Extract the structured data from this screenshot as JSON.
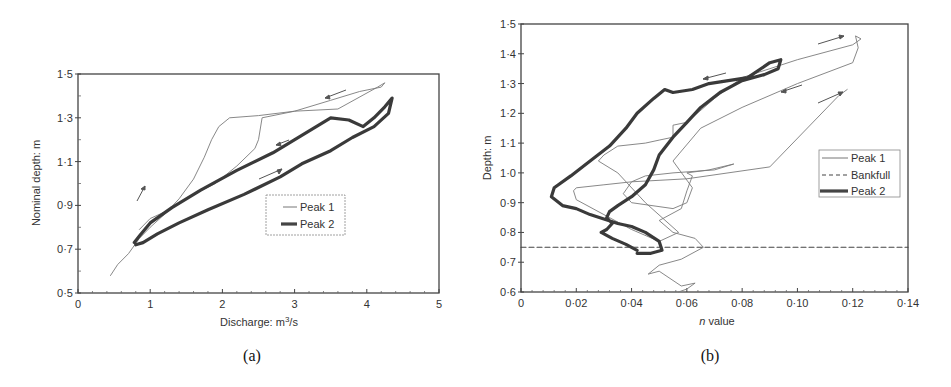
{
  "chart_data": [
    {
      "type": "line",
      "panel": "a",
      "caption": "(a)",
      "title": "",
      "xlabel": "Discharge: m³/s",
      "ylabel": "Nominal depth: m",
      "xlim": [
        0,
        5
      ],
      "ylim": [
        0.5,
        1.5
      ],
      "xticks": [
        "0",
        "1",
        "2",
        "3",
        "4",
        "5"
      ],
      "yticks": [
        "0·5",
        "0·7",
        "0·9",
        "1·1",
        "1·3",
        "1·5"
      ],
      "grid": false,
      "legend": {
        "position": "center-right",
        "entries": [
          "Peak 1",
          "Peak 2"
        ]
      },
      "series": [
        {
          "name": "Peak 1",
          "style": "thin",
          "x": [
            0.45,
            0.55,
            0.7,
            0.85,
            1.0,
            1.2,
            1.4,
            1.6,
            1.75,
            1.85,
            1.95,
            2.1,
            2.5,
            3.0,
            3.5,
            3.9,
            4.2,
            4.25,
            4.15,
            3.6,
            3.0,
            2.55,
            2.5,
            2.45,
            2.2,
            1.9,
            1.6,
            1.4,
            1.2,
            1.0,
            0.85
          ],
          "y": [
            0.58,
            0.63,
            0.68,
            0.75,
            0.8,
            0.86,
            0.93,
            1.02,
            1.12,
            1.2,
            1.26,
            1.3,
            1.31,
            1.33,
            1.38,
            1.42,
            1.44,
            1.46,
            1.44,
            1.34,
            1.33,
            1.3,
            1.2,
            1.16,
            1.08,
            1.0,
            0.95,
            0.91,
            0.87,
            0.84,
            0.79
          ]
        },
        {
          "name": "Peak 2",
          "style": "thick",
          "x": [
            0.8,
            0.9,
            1.1,
            1.4,
            1.8,
            2.3,
            2.8,
            3.1,
            3.5,
            3.8,
            4.1,
            4.3,
            4.35,
            4.25,
            4.1,
            3.95,
            3.75,
            3.5,
            3.1,
            2.7,
            2.2,
            1.7,
            1.3,
            1.0,
            0.85,
            0.78
          ],
          "y": [
            0.72,
            0.73,
            0.77,
            0.82,
            0.88,
            0.95,
            1.03,
            1.09,
            1.15,
            1.21,
            1.26,
            1.32,
            1.39,
            1.35,
            1.3,
            1.26,
            1.29,
            1.3,
            1.22,
            1.14,
            1.06,
            0.97,
            0.89,
            0.82,
            0.76,
            0.73
          ]
        }
      ],
      "annotations": [
        "arrow up-right at Q~1.9 (rising limb)",
        "arrow left at top near Q~3.8",
        "arrow left near Q~2.7,1.2",
        "arrow right near Q~2.8,1.05"
      ]
    },
    {
      "type": "line",
      "panel": "b",
      "caption": "(b)",
      "title": "",
      "xlabel": "n value",
      "ylabel": "Depth: m",
      "xlim": [
        0,
        0.14
      ],
      "ylim": [
        0.6,
        1.5
      ],
      "xticks": [
        "0",
        "0·02",
        "0·04",
        "0·06",
        "0·08",
        "0·10",
        "0·12",
        "0·14"
      ],
      "yticks": [
        "0·6",
        "0·7",
        "0·8",
        "0·9",
        "1·0",
        "1·1",
        "1·2",
        "1·3",
        "1·4",
        "1·5"
      ],
      "grid": false,
      "legend": {
        "position": "center-right",
        "entries": [
          "Peak 1",
          "Bankfull",
          "Peak 2"
        ]
      },
      "series": [
        {
          "name": "Peak 1",
          "style": "thin",
          "x": [
            0.057,
            0.06,
            0.063,
            0.058,
            0.05,
            0.046,
            0.05,
            0.058,
            0.066,
            0.063,
            0.055,
            0.05,
            0.058,
            0.06,
            0.062,
            0.06,
            0.068,
            0.077,
            0.07,
            0.055,
            0.045,
            0.04,
            0.037,
            0.04,
            0.055,
            0.06,
            0.062,
            0.055,
            0.065,
            0.08,
            0.1,
            0.12,
            0.122,
            0.121,
            0.123,
            0.12,
            0.1,
            0.09,
            0.08,
            0.07,
            0.06,
            0.055,
            0.055,
            0.05,
            0.045,
            0.035,
            0.03,
            0.028,
            0.035,
            0.045,
            0.057,
            0.05,
            0.04,
            0.03,
            0.02,
            0.019,
            0.02,
            0.03,
            0.04,
            0.06,
            0.09,
            0.115,
            0.118
          ],
          "y": [
            0.6,
            0.61,
            0.63,
            0.62,
            0.67,
            0.66,
            0.69,
            0.71,
            0.75,
            0.78,
            0.8,
            0.84,
            0.88,
            0.94,
            0.99,
            1.0,
            1.01,
            1.03,
            1.01,
            1.0,
            0.99,
            0.97,
            0.93,
            0.9,
            0.88,
            0.9,
            0.95,
            1.04,
            1.15,
            1.22,
            1.3,
            1.37,
            1.42,
            1.46,
            1.45,
            1.43,
            1.38,
            1.35,
            1.32,
            1.25,
            1.17,
            1.16,
            1.12,
            1.11,
            1.1,
            1.09,
            1.06,
            1.04,
            1.0,
            0.9,
            0.8,
            0.77,
            0.81,
            0.86,
            0.91,
            0.94,
            0.95,
            0.96,
            0.97,
            0.98,
            1.02,
            1.26,
            1.28
          ]
        },
        {
          "name": "Peak 2",
          "style": "thick",
          "x": [
            0.042,
            0.047,
            0.051,
            0.05,
            0.045,
            0.04,
            0.035,
            0.03,
            0.025,
            0.02,
            0.015,
            0.011,
            0.012,
            0.018,
            0.025,
            0.032,
            0.038,
            0.042,
            0.048,
            0.052,
            0.055,
            0.062,
            0.068,
            0.075,
            0.082,
            0.09,
            0.094,
            0.093,
            0.088,
            0.08,
            0.072,
            0.065,
            0.06,
            0.055,
            0.05,
            0.048,
            0.045,
            0.04,
            0.035,
            0.032,
            0.031,
            0.033,
            0.031,
            0.029,
            0.033,
            0.038,
            0.042
          ],
          "y": [
            0.73,
            0.73,
            0.74,
            0.77,
            0.8,
            0.82,
            0.83,
            0.845,
            0.86,
            0.88,
            0.89,
            0.92,
            0.95,
            0.99,
            1.04,
            1.09,
            1.15,
            1.2,
            1.25,
            1.28,
            1.27,
            1.28,
            1.3,
            1.31,
            1.32,
            1.37,
            1.38,
            1.35,
            1.33,
            1.31,
            1.27,
            1.22,
            1.17,
            1.12,
            1.06,
            1.01,
            0.96,
            0.92,
            0.89,
            0.87,
            0.85,
            0.83,
            0.81,
            0.8,
            0.78,
            0.76,
            0.74
          ]
        },
        {
          "name": "Bankfull",
          "style": "dashed",
          "x": [
            0,
            0.14
          ],
          "y": [
            0.75,
            0.75
          ]
        }
      ],
      "annotations": [
        "arrow right near top (n~0.11,1.43)",
        "arrow left near (0.07,1.32)",
        "arrow left near (0.1,1.28)",
        "arrow right near (0.11,1.24)"
      ]
    }
  ]
}
